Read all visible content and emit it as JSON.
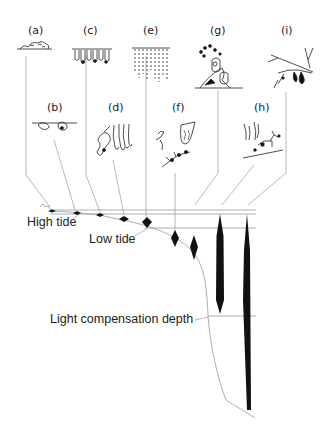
{
  "figure": {
    "panel_labels": [
      {
        "id": "a",
        "text": "(a)",
        "x": 29,
        "y": 22
      },
      {
        "id": "b",
        "text": "(b)",
        "x": 47,
        "y": 100
      },
      {
        "id": "c",
        "text": "(c)",
        "x": 84,
        "y": 22
      },
      {
        "id": "d",
        "text": "(d)",
        "x": 108,
        "y": 100
      },
      {
        "id": "e",
        "text": "(e)",
        "x": 145,
        "y": 22
      },
      {
        "id": "f",
        "text": "(f)",
        "x": 172,
        "y": 100
      },
      {
        "id": "g",
        "text": "(g)",
        "x": 210,
        "y": 22
      },
      {
        "id": "h",
        "text": "(h)",
        "x": 254,
        "y": 100
      },
      {
        "id": "i",
        "text": "(i)",
        "x": 281,
        "y": 22
      }
    ],
    "zone_labels": {
      "high_tide": "High tide",
      "low_tide": "Low tide",
      "light_compensation_depth": "Light compensation depth"
    },
    "colors": {
      "ink": "#111111",
      "line": "#8a8a8a",
      "background": "#ffffff"
    }
  }
}
